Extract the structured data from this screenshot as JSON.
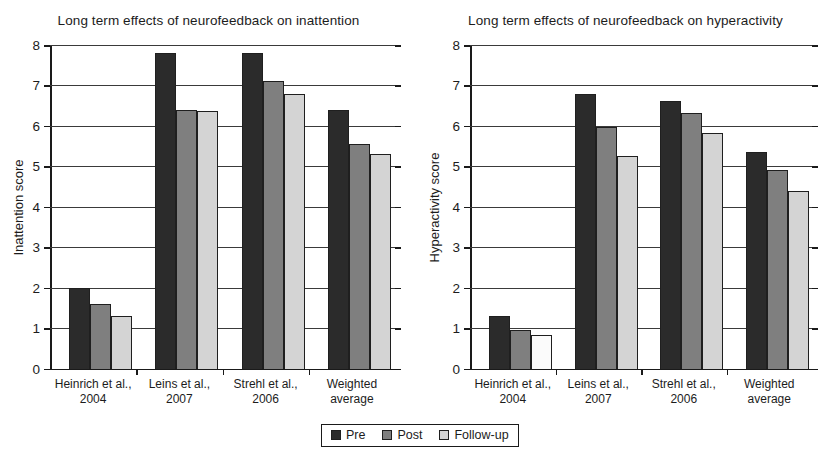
{
  "legend": {
    "items": [
      {
        "label": "Pre",
        "key": "pre",
        "color": "#2b2b2b"
      },
      {
        "label": "Post",
        "key": "post",
        "color": "#7f7f7f"
      },
      {
        "label": "Follow-up",
        "key": "follow",
        "color": "#d4d4d4"
      }
    ]
  },
  "charts": [
    {
      "title": "Long term effects of neurofeedback on inattention",
      "ylabel": "Inattention score"
    },
    {
      "title": "Long term effects of neurofeedback on hyperactivity",
      "ylabel": "Hyperactivity score"
    }
  ],
  "chart_data": [
    {
      "type": "bar",
      "title": "Long term effects of neurofeedback on inattention",
      "xlabel": "",
      "ylabel": "Inattention score",
      "ylim": [
        0,
        8
      ],
      "yticks": [
        0,
        1,
        2,
        3,
        4,
        5,
        6,
        7,
        8
      ],
      "grid": true,
      "legend_position": "bottom-center",
      "categories": [
        "Heinrich et al., 2004",
        "Leins et al., 2007",
        "Strehl et al., 2006",
        "Weighted average"
      ],
      "category_lines": [
        [
          "Heinrich et al.,",
          "2004"
        ],
        [
          "Leins et al.,",
          "2007"
        ],
        [
          "Strehl et al.,",
          "2006"
        ],
        [
          "Weighted",
          "average"
        ]
      ],
      "series": [
        {
          "name": "Pre",
          "color": "#2b2b2b",
          "values": [
            2.0,
            7.8,
            7.8,
            6.4
          ]
        },
        {
          "name": "Post",
          "color": "#7f7f7f",
          "values": [
            1.6,
            6.4,
            7.1,
            5.55
          ]
        },
        {
          "name": "Follow-up",
          "color": "#d4d4d4",
          "values": [
            1.3,
            6.38,
            6.8,
            5.3
          ]
        }
      ]
    },
    {
      "type": "bar",
      "title": "Long term effects of neurofeedback on hyperactivity",
      "xlabel": "",
      "ylabel": "Hyperactivity score",
      "ylim": [
        0,
        8
      ],
      "yticks": [
        0,
        1,
        2,
        3,
        4,
        5,
        6,
        7,
        8
      ],
      "grid": true,
      "legend_position": "bottom-center",
      "categories": [
        "Heinrich et al., 2004",
        "Leins et al., 2007",
        "Strehl et al., 2006",
        "Weighted average"
      ],
      "category_lines": [
        [
          "Heinrich et al.,",
          "2004"
        ],
        [
          "Leins et al.,",
          "2007"
        ],
        [
          "Strehl et al.,",
          "2006"
        ],
        [
          "Weighted",
          "average"
        ]
      ],
      "series": [
        {
          "name": "Pre",
          "color": "#2b2b2b",
          "values": [
            1.3,
            6.78,
            6.62,
            5.36
          ]
        },
        {
          "name": "Post",
          "color": "#7f7f7f",
          "values": [
            0.95,
            5.97,
            6.33,
            4.9
          ]
        },
        {
          "name": "Follow-up",
          "color": "#d4d4d4",
          "values": [
            0.83,
            5.25,
            5.82,
            4.38
          ]
        }
      ]
    }
  ]
}
